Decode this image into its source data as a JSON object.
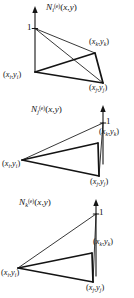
{
  "figure": {
    "type": "triangular-element-shape-functions",
    "background_color": "#ffffff",
    "line_color": "#141414",
    "panels": [
      {
        "id": "panel-i",
        "function_label": "N",
        "function_sub": "i",
        "function_sup": "(e)",
        "function_args": "(x, y)",
        "peak_vertex": "i",
        "peak_value": "1",
        "vertices": [
          {
            "key": "i",
            "label_x": "x",
            "label_y": "y",
            "sub": "i",
            "text": "(x_i, y_i)"
          },
          {
            "key": "j",
            "label_x": "x",
            "label_y": "y",
            "sub": "j",
            "text": "(x_j, y_j)"
          },
          {
            "key": "k",
            "label_x": "x",
            "label_y": "y",
            "sub": "k",
            "text": "(x_k, y_k)"
          }
        ]
      },
      {
        "id": "panel-j",
        "function_label": "N",
        "function_sub": "j",
        "function_sup": "(e)",
        "function_args": "(x, y)",
        "peak_vertex": "k",
        "peak_value": "1",
        "vertices": [
          {
            "key": "i",
            "label_x": "x",
            "label_y": "y",
            "sub": "i",
            "text": "(x_i, y_i)"
          },
          {
            "key": "j",
            "label_x": "x",
            "label_y": "y",
            "sub": "j",
            "text": "(x_j, y_j)"
          },
          {
            "key": "k",
            "label_x": "x",
            "label_y": "y",
            "sub": "k",
            "text": "(x_k, y_k)"
          }
        ]
      },
      {
        "id": "panel-k",
        "function_label": "N",
        "function_sub": "k",
        "function_sup": "(e)",
        "function_args": "(x, y)",
        "peak_vertex": "k",
        "peak_value": "1",
        "vertices": [
          {
            "key": "i",
            "label_x": "x",
            "label_y": "y",
            "sub": "i",
            "text": "(x_i, y_i)"
          },
          {
            "key": "j",
            "label_x": "x",
            "label_y": "y",
            "sub": "j",
            "text": "(x_j, y_j)"
          },
          {
            "key": "k",
            "label_x": "x",
            "label_y": "y",
            "sub": "k",
            "text": "(x_k, y_k)"
          }
        ]
      }
    ],
    "peak_tick_label": "1"
  }
}
